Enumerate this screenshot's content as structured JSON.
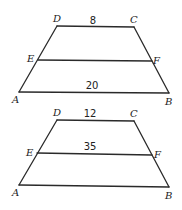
{
  "figures": [
    {
      "id": "trapezoid-1",
      "vertices": {
        "A": {
          "label": "A",
          "x": 19,
          "y": 92,
          "lx": 12,
          "ly": 103
        },
        "B": {
          "label": "B",
          "x": 169,
          "y": 93,
          "lx": 165,
          "ly": 105
        },
        "C": {
          "label": "C",
          "x": 134,
          "y": 27,
          "lx": 130,
          "ly": 23
        },
        "D": {
          "label": "D",
          "x": 57,
          "y": 26,
          "lx": 53,
          "ly": 22
        },
        "E": {
          "label": "E",
          "x": 38,
          "y": 60,
          "lx": 27,
          "ly": 62
        },
        "F": {
          "label": "F",
          "x": 152,
          "y": 61,
          "lx": 153,
          "ly": 64
        }
      },
      "segment_labels": {
        "DC": {
          "text": "8",
          "x": 93,
          "y": 24
        },
        "EF": {
          "text": "",
          "x": 95,
          "y": 57
        },
        "AB": {
          "text": "20",
          "x": 92,
          "y": 89
        }
      }
    },
    {
      "id": "trapezoid-2",
      "vertices": {
        "A": {
          "label": "A",
          "x": 19,
          "y": 185,
          "lx": 12,
          "ly": 196
        },
        "B": {
          "label": "B",
          "x": 169,
          "y": 187,
          "lx": 165,
          "ly": 199
        },
        "C": {
          "label": "C",
          "x": 134,
          "y": 121,
          "lx": 130,
          "ly": 117
        },
        "D": {
          "label": "D",
          "x": 57,
          "y": 120,
          "lx": 53,
          "ly": 116
        },
        "E": {
          "label": "E",
          "x": 37,
          "y": 153,
          "lx": 26,
          "ly": 156
        },
        "F": {
          "label": "F",
          "x": 152,
          "y": 155,
          "lx": 154,
          "ly": 158
        }
      },
      "segment_labels": {
        "DC": {
          "text": "12",
          "x": 90,
          "y": 117
        },
        "EF": {
          "text": "35",
          "x": 90,
          "y": 150
        },
        "AB": {
          "text": "",
          "x": 92,
          "y": 183
        }
      }
    }
  ]
}
